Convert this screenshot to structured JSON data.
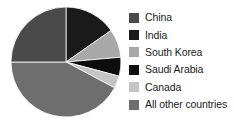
{
  "chart_data": {
    "type": "pie",
    "title": "",
    "categories": [
      "China",
      "India",
      "South Korea",
      "Saudi Arabia",
      "Canada",
      "All other countries"
    ],
    "values": [
      25.0,
      15.3,
      8.3,
      5.6,
      3.6,
      42.2
    ],
    "units": "percent",
    "legend_position": "right",
    "grid": false,
    "start_angle_deg": 0,
    "direction": "clockwise",
    "slices": [
      {
        "label": "India",
        "value": 15.3,
        "start_deg": 0,
        "end_deg": 55,
        "color": "#1a1a1a"
      },
      {
        "label": "South Korea",
        "value": 8.3,
        "start_deg": 55,
        "end_deg": 85,
        "color": "#a8a8a8"
      },
      {
        "label": "Saudi Arabia",
        "value": 5.6,
        "start_deg": 85,
        "end_deg": 105,
        "color": "#0d0d0d"
      },
      {
        "label": "Canada",
        "value": 3.6,
        "start_deg": 105,
        "end_deg": 118,
        "color": "#c4c4c4"
      },
      {
        "label": "All other countries",
        "value": 42.2,
        "start_deg": 118,
        "end_deg": 270,
        "color": "#6e6e6e"
      },
      {
        "label": "China",
        "value": 25.0,
        "start_deg": 270,
        "end_deg": 360,
        "color": "#4a4a4a"
      }
    ]
  },
  "legend": {
    "items": [
      {
        "label": "China",
        "color": "#4a4a4a"
      },
      {
        "label": "India",
        "color": "#1a1a1a"
      },
      {
        "label": "South Korea",
        "color": "#a8a8a8"
      },
      {
        "label": "Saudi Arabia",
        "color": "#0d0d0d"
      },
      {
        "label": "Canada",
        "color": "#c4c4c4"
      },
      {
        "label": "All other countries",
        "color": "#6e6e6e"
      }
    ]
  }
}
